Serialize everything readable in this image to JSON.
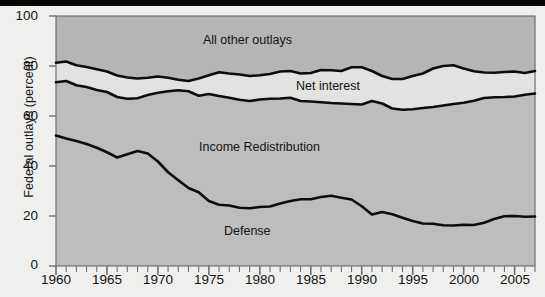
{
  "figure": {
    "background_color": "#efefee",
    "plot_fill_upper": "#b5b5b5",
    "plot_fill_band": "#e2e2e0",
    "plot_fill_lower": "#bdbdbd",
    "line_color": "#0d0d0d",
    "axis_color": "#6f6f6f"
  },
  "chart_data": {
    "type": "area",
    "title": "",
    "subtitle": "",
    "xlabel": "",
    "ylabel": "Federal outlays (percent)",
    "xlim": [
      1960,
      2007
    ],
    "ylim": [
      0,
      100
    ],
    "grid": false,
    "legend_position": "inline-annotations",
    "ytick_labels": [
      "0",
      "20",
      "40",
      "60",
      "80",
      "100"
    ],
    "ytick_values": [
      0,
      20,
      40,
      60,
      80,
      100
    ],
    "xtick_labels": [
      "1960",
      "1965",
      "1970",
      "1975",
      "1980",
      "1985",
      "1990",
      "1995",
      "2000",
      "2005"
    ],
    "xtick_values": [
      1960,
      1965,
      1970,
      1975,
      1980,
      1985,
      1990,
      1995,
      2000,
      2005
    ],
    "minor_xtick_step": 1,
    "annotations": [
      {
        "text": "All other outlays",
        "x": 1981,
        "y": 92
      },
      {
        "text": "Net interest",
        "x": 1993,
        "y": 73
      },
      {
        "text": "Income Redistribution",
        "x": 1985,
        "y": 52
      },
      {
        "text": "Defense",
        "x": 1983,
        "y": 20
      }
    ],
    "x": [
      1960,
      1961,
      1962,
      1963,
      1964,
      1965,
      1966,
      1967,
      1968,
      1969,
      1970,
      1971,
      1972,
      1973,
      1974,
      1975,
      1976,
      1977,
      1978,
      1979,
      1980,
      1981,
      1982,
      1983,
      1984,
      1985,
      1986,
      1987,
      1988,
      1989,
      1990,
      1991,
      1992,
      1993,
      1994,
      1995,
      1996,
      1997,
      1998,
      1999,
      2000,
      2001,
      2002,
      2003,
      2004,
      2005,
      2006,
      2007
    ],
    "series": [
      {
        "name": "Defense",
        "description": "Cumulative boundary: top of the Defense band",
        "values": [
          52.2,
          51.0,
          50.0,
          48.8,
          47.3,
          45.5,
          43.4,
          44.7,
          46.0,
          45.0,
          41.8,
          37.5,
          34.3,
          31.2,
          29.5,
          26.0,
          24.5,
          24.2,
          23.3,
          23.1,
          23.6,
          23.8,
          25.0,
          26.0,
          26.7,
          26.7,
          27.6,
          28.1,
          27.3,
          26.6,
          23.9,
          20.6,
          21.6,
          20.7,
          19.3,
          18.0,
          17.0,
          16.9,
          16.3,
          16.2,
          16.5,
          16.4,
          17.3,
          18.8,
          19.9,
          20.0,
          19.7,
          19.8
        ]
      },
      {
        "name": "Income Redistribution",
        "description": "Cumulative boundary: top of the Income Redistribution band",
        "values": [
          73.5,
          74.0,
          72.3,
          71.6,
          70.4,
          69.6,
          67.6,
          66.9,
          67.1,
          68.4,
          69.3,
          69.9,
          70.3,
          69.9,
          68.1,
          68.8,
          68.0,
          67.3,
          66.5,
          66.0,
          66.6,
          66.9,
          67.0,
          67.3,
          66.0,
          65.8,
          65.5,
          65.2,
          65.0,
          64.8,
          64.6,
          66.0,
          65.0,
          63.0,
          62.5,
          62.7,
          63.2,
          63.6,
          64.2,
          64.8,
          65.3,
          66.1,
          67.2,
          67.5,
          67.6,
          67.8,
          68.5,
          69.0
        ]
      },
      {
        "name": "Net interest",
        "description": "Cumulative boundary: top of the Net interest band",
        "values": [
          81.3,
          81.8,
          80.3,
          79.6,
          78.7,
          77.8,
          76.2,
          75.4,
          75.0,
          75.3,
          75.8,
          75.3,
          74.5,
          74.0,
          75.0,
          76.3,
          77.5,
          77.0,
          76.6,
          76.0,
          76.3,
          76.8,
          77.8,
          78.0,
          77.0,
          77.2,
          78.4,
          78.3,
          78.0,
          79.5,
          79.5,
          78.0,
          76.0,
          74.8,
          74.8,
          76.0,
          77.0,
          79.0,
          80.0,
          80.3,
          79.0,
          77.9,
          77.4,
          77.3,
          77.6,
          77.8,
          77.2,
          78.0
        ]
      },
      {
        "name": "All other outlays",
        "description": "Top band, spans up to 100 percent of federal outlays",
        "values": [
          100,
          100,
          100,
          100,
          100,
          100,
          100,
          100,
          100,
          100,
          100,
          100,
          100,
          100,
          100,
          100,
          100,
          100,
          100,
          100,
          100,
          100,
          100,
          100,
          100,
          100,
          100,
          100,
          100,
          100,
          100,
          100,
          100,
          100,
          100,
          100,
          100,
          100,
          100,
          100,
          100,
          100,
          100,
          100,
          100,
          100,
          100,
          100
        ]
      }
    ]
  }
}
